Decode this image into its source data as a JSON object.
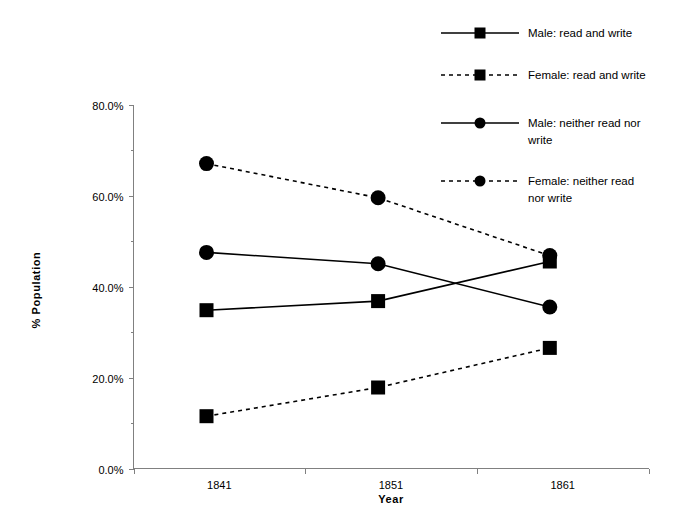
{
  "chart_data": {
    "type": "line",
    "title": "",
    "xlabel": "Year",
    "ylabel": "% Population",
    "categories": [
      "1841",
      "1851",
      "1861"
    ],
    "ylim": [
      0,
      80
    ],
    "ytick_labels": [
      "0.0%",
      "20.0%",
      "40.0%",
      "60.0%",
      "80.0%"
    ],
    "ytick_values": [
      0,
      20,
      40,
      60,
      80
    ],
    "grid": false,
    "legend_position": "top-right",
    "series": [
      {
        "name": "Male: read and write",
        "values": [
          34.8,
          36.8,
          45.5
        ],
        "line_style": "solid",
        "marker": "square"
      },
      {
        "name": "Female: read and write",
        "values": [
          11.5,
          17.8,
          26.5
        ],
        "line_style": "dashed",
        "marker": "square"
      },
      {
        "name": "Male: neither read nor write",
        "values": [
          47.5,
          45.0,
          35.5
        ],
        "line_style": "solid",
        "marker": "circle"
      },
      {
        "name": "Female: neither read nor write",
        "values": [
          67.0,
          59.5,
          46.8
        ],
        "line_style": "dashed",
        "marker": "circle"
      }
    ]
  },
  "legend": {
    "entries": [
      {
        "label": "Male: read and write"
      },
      {
        "label": "Female: read and write"
      },
      {
        "label": "Male: neither read nor write",
        "line2": "write",
        "line1": "Male: neither read nor"
      },
      {
        "label": "Female: neither read nor write",
        "line1": "Female: neither read",
        "line2": "nor write"
      }
    ]
  },
  "axes": {
    "y_title": "% Population",
    "x_title": "Year"
  }
}
